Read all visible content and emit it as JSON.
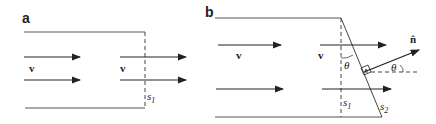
{
  "figure": {
    "panels": [
      {
        "label": "a",
        "velocity_label": "v",
        "velocity_label_2": "v",
        "surface_label": "s",
        "surface_sub": "1"
      },
      {
        "label": "b",
        "velocity_label": "v",
        "velocity_label_2": "v",
        "surface1_label": "s",
        "surface1_sub": "1",
        "surface2_label": "s",
        "surface2_sub": "2",
        "angle_label": "θ",
        "angle_label_2": "θ",
        "normal_label": "n̂",
        "right_angle_mark": "·"
      }
    ],
    "colors": {
      "line": "#333333",
      "box": "#555555"
    }
  }
}
